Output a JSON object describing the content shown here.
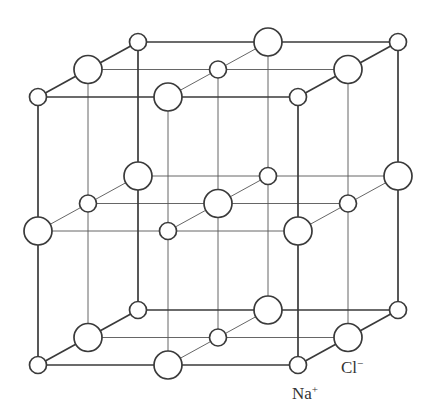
{
  "diagram": {
    "grid": {
      "origin": [
        38,
        365
      ],
      "x_step": 130,
      "y_step": -134,
      "z_step": [
        50,
        -27.5
      ],
      "n": 3
    },
    "ions": {
      "na": {
        "name": "Na",
        "charge": "+",
        "radius": 8.5,
        "color": "#ffffff"
      },
      "cl": {
        "name": "Cl",
        "charge": "−",
        "radius": 14,
        "color": "#ffffff"
      }
    },
    "labels": [
      {
        "id": "na-label",
        "text": "Na",
        "sup": "+",
        "x": 292,
        "y": 384
      },
      {
        "id": "cl-label",
        "text": "Cl",
        "sup": "−",
        "x": 341,
        "y": 358
      }
    ],
    "line_color": "#3a3a3a"
  }
}
